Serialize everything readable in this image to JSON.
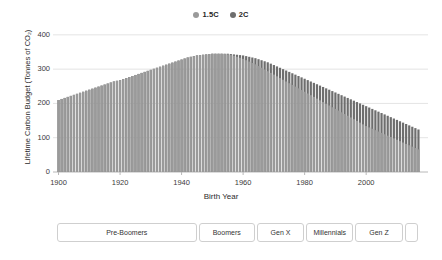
{
  "legend": {
    "position": "top-center",
    "items": [
      {
        "label": "1.5C",
        "color": "#9a9a9a",
        "icon": "circle-marker-icon"
      },
      {
        "label": "2C",
        "color": "#6e6e6e",
        "icon": "circle-marker-icon"
      }
    ]
  },
  "axes": {
    "y_title": "Lifetime Carbon Budget (Tonnes of CO₂)",
    "x_title": "Birth Year",
    "y_ticks": [
      "0",
      "100",
      "200",
      "300",
      "400"
    ],
    "x_ticks": [
      "1900",
      "1920",
      "1940",
      "1960",
      "1980",
      "2000"
    ]
  },
  "generations": {
    "boxes": [
      {
        "label": "Pre-Boomers",
        "start": 1900,
        "end": 1945
      },
      {
        "label": "Boomers",
        "start": 1946,
        "end": 1964
      },
      {
        "label": "Gen X",
        "start": 1965,
        "end": 1980
      },
      {
        "label": "Millennials",
        "start": 1981,
        "end": 1996
      },
      {
        "label": "Gen Z",
        "start": 1997,
        "end": 2012
      },
      {
        "label": "",
        "start": 2013,
        "end": 2017
      }
    ]
  },
  "chart_data": {
    "type": "bar",
    "title": "",
    "xlabel": "Birth Year",
    "ylabel": "Lifetime Carbon Budget (Tonnes of CO₂)",
    "xlim": [
      1900,
      2017
    ],
    "ylim": [
      0,
      420
    ],
    "ytick_values": [
      0,
      100,
      200,
      300,
      400
    ],
    "xtick_values": [
      1900,
      1920,
      1940,
      1960,
      1980,
      2000
    ],
    "grid": "horizontal",
    "legend_position": "top-center",
    "x": [
      1900,
      1901,
      1902,
      1903,
      1904,
      1905,
      1906,
      1907,
      1908,
      1909,
      1910,
      1911,
      1912,
      1913,
      1914,
      1915,
      1916,
      1917,
      1918,
      1919,
      1920,
      1921,
      1922,
      1923,
      1924,
      1925,
      1926,
      1927,
      1928,
      1929,
      1930,
      1931,
      1932,
      1933,
      1934,
      1935,
      1936,
      1937,
      1938,
      1939,
      1940,
      1941,
      1942,
      1943,
      1944,
      1945,
      1946,
      1947,
      1948,
      1949,
      1950,
      1951,
      1952,
      1953,
      1954,
      1955,
      1956,
      1957,
      1958,
      1959,
      1960,
      1961,
      1962,
      1963,
      1964,
      1965,
      1966,
      1967,
      1968,
      1969,
      1970,
      1971,
      1972,
      1973,
      1974,
      1975,
      1976,
      1977,
      1978,
      1979,
      1980,
      1981,
      1982,
      1983,
      1984,
      1985,
      1986,
      1987,
      1988,
      1989,
      1990,
      1991,
      1992,
      1993,
      1994,
      1995,
      1996,
      1997,
      1998,
      1999,
      2000,
      2001,
      2002,
      2003,
      2004,
      2005,
      2006,
      2007,
      2008,
      2009,
      2010,
      2011,
      2012,
      2013,
      2014,
      2015,
      2016,
      2017
    ],
    "series": [
      {
        "name": "2C",
        "color": "#6e6e6e",
        "values": [
          210,
          213,
          216,
          219,
          222,
          225,
          228,
          231,
          234,
          237,
          240,
          243,
          246,
          249,
          252,
          255,
          258,
          261,
          264,
          266,
          268,
          271,
          274,
          277,
          280,
          283,
          286,
          289,
          292,
          295,
          298,
          301,
          304,
          307,
          310,
          313,
          316,
          319,
          322,
          325,
          328,
          331,
          334,
          336,
          338,
          340,
          341,
          342,
          343,
          344,
          345,
          345,
          345,
          345,
          345,
          345,
          344,
          343,
          342,
          341,
          340,
          338,
          336,
          334,
          332,
          329,
          326,
          323,
          320,
          316,
          312,
          308,
          304,
          300,
          296,
          292,
          288,
          284,
          280,
          276,
          272,
          268,
          264,
          260,
          256,
          252,
          248,
          244,
          240,
          236,
          232,
          228,
          224,
          220,
          216,
          212,
          208,
          204,
          200,
          196,
          192,
          188,
          184,
          180,
          176,
          172,
          168,
          164,
          160,
          156,
          152,
          148,
          144,
          140,
          136,
          132,
          128,
          124
        ]
      },
      {
        "name": "1.5C",
        "color": "#9a9a9a",
        "values": [
          210,
          213,
          216,
          219,
          222,
          225,
          228,
          231,
          234,
          237,
          240,
          243,
          246,
          249,
          252,
          255,
          258,
          261,
          264,
          266,
          268,
          271,
          274,
          277,
          280,
          283,
          286,
          289,
          292,
          295,
          298,
          301,
          304,
          307,
          310,
          313,
          316,
          319,
          322,
          325,
          328,
          331,
          334,
          336,
          338,
          340,
          341,
          342,
          343,
          344,
          345,
          345,
          345,
          345,
          344,
          343,
          341,
          339,
          336,
          333,
          330,
          326,
          322,
          318,
          314,
          309,
          304,
          299,
          294,
          289,
          284,
          279,
          274,
          269,
          264,
          259,
          254,
          249,
          244,
          239,
          234,
          229,
          224,
          219,
          214,
          209,
          204,
          199,
          194,
          189,
          184,
          179,
          174,
          169,
          164,
          159,
          154,
          149,
          144,
          139,
          134,
          130,
          126,
          122,
          118,
          114,
          110,
          106,
          102,
          98,
          94,
          90,
          86,
          82,
          78,
          74,
          70,
          66
        ]
      }
    ]
  }
}
